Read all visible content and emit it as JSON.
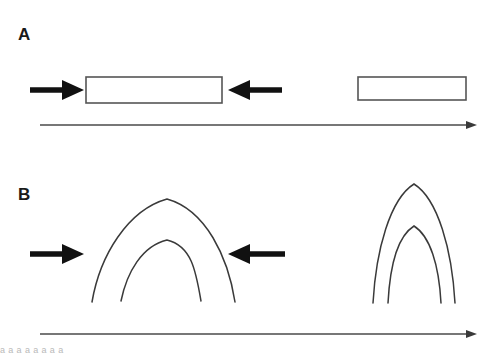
{
  "figure": {
    "background_color": "#ffffff",
    "width": 489,
    "height": 353,
    "caption_fragment": "a             a                      a                 a        a              a    a      a"
  },
  "panels": [
    {
      "id": "A",
      "label": "A",
      "label_x": 18,
      "label_y": 40,
      "description": "undeformed tabular layer shortened by horizontal compression",
      "initial_state": {
        "name": "shortened-layer-block",
        "shape": "rectangle",
        "x": 86,
        "y": 77,
        "width": 136,
        "height": 26,
        "fill": "#ffffff",
        "stroke": "#555555"
      },
      "final_state": {
        "name": "original-layer-block",
        "shape": "rectangle",
        "x": 358,
        "y": 77,
        "width": 108,
        "height": 23,
        "fill": "#ffffff",
        "stroke": "#555555"
      },
      "stress_arrows": [
        {
          "name": "compression-arrow-left",
          "direction": "right",
          "tip_x": 84,
          "tail_x": 30,
          "y": 90
        },
        {
          "name": "compression-arrow-right",
          "direction": "left",
          "tip_x": 228,
          "tail_x": 282,
          "y": 90
        }
      ],
      "time_axis": {
        "name": "time-axis-panel-a",
        "x_start": 40,
        "x_end": 477,
        "y": 125,
        "color": "#4a4a4a"
      }
    },
    {
      "id": "B",
      "label": "B",
      "label_x": 18,
      "label_y": 200,
      "description": "open anticline fold tightened into an upright tight fold by continued shortening",
      "initial_state": {
        "name": "open-fold",
        "shape": "nested-arch-pair",
        "outer": {
          "left_x": 92,
          "right_x": 235,
          "crest_x": 167,
          "crest_y": 199,
          "base_y": 300
        },
        "inner": {
          "left_x": 121,
          "right_x": 201,
          "crest_x": 167,
          "crest_y": 240,
          "base_y": 300
        },
        "stroke": "#3a3a3a"
      },
      "final_state": {
        "name": "tight-fold",
        "shape": "nested-arch-pair",
        "outer": {
          "left_x": 373,
          "right_x": 455,
          "crest_x": 414,
          "crest_y": 184,
          "base_y": 303
        },
        "inner": {
          "left_x": 388,
          "right_x": 441,
          "crest_x": 414,
          "crest_y": 226,
          "base_y": 303
        },
        "stroke": "#3a3a3a"
      },
      "stress_arrows": [
        {
          "name": "compression-arrow-left",
          "direction": "right",
          "tip_x": 84,
          "tail_x": 30,
          "y": 254
        },
        {
          "name": "compression-arrow-right",
          "direction": "left",
          "tip_x": 228,
          "tail_x": 285,
          "y": 254
        }
      ],
      "time_axis": {
        "name": "time-axis-panel-b",
        "x_start": 40,
        "x_end": 477,
        "y": 334,
        "color": "#4a4a4a"
      }
    }
  ]
}
